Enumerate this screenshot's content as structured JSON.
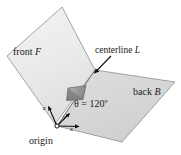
{
  "figure": {
    "background": "#ffffff",
    "width": 181,
    "height": 155,
    "labels": {
      "front_prefix": "front ",
      "front_symbol": "F",
      "centerline_prefix": "centerline ",
      "centerline_symbol": "L",
      "back_prefix": "back ",
      "back_symbol": "B",
      "angle_text": "θ = 120º",
      "origin_text": "origin",
      "axis_z": "z",
      "axis_y": "y",
      "axis_x": "x"
    },
    "colors": {
      "front_panel_fill": "#ebebeb",
      "front_panel_edge": "#8d8d8d",
      "back_panel_fill": "#d9d9d9",
      "back_panel_edge": "#8d8d8d",
      "wedge_fill": "#8f8f8f",
      "wedge_edge": "#5a5a5a",
      "axis_line": "#111111",
      "text": "#1a1a1a",
      "leader_line": "#111111"
    },
    "geometry": {
      "front_panel_points": "62,7 7,56 55,124 95,70",
      "back_panel_points": "95,70 175,82 122,142 57,126",
      "centerline": {
        "x1": 95,
        "y1": 70,
        "x2": 57,
        "y2": 126
      },
      "wedge_points": "68,88 85,86 82,99 66,100",
      "leader_arrow": {
        "x1": 110,
        "y1": 57,
        "x2": 94,
        "y2": 73
      },
      "origin_point": {
        "cx": 57,
        "cy": 126,
        "r": 2.1
      },
      "axis_z_end": {
        "x": 48,
        "y": 105
      },
      "axis_y_end": {
        "x": 70,
        "y": 113
      },
      "axis_x_end": {
        "x": 80,
        "y": 126
      }
    },
    "angle_value_degrees": 120
  }
}
